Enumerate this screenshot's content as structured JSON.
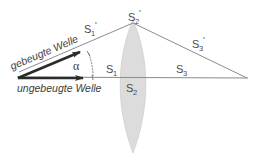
{
  "figure": {
    "background_color": "#ffffff"
  },
  "colors": {
    "lens_fill": "#dcdcdc",
    "lens_stroke": "#c8c8c8",
    "ray_stroke": "#8c8c8c",
    "axis_stroke": "#8c8c8c",
    "arrow_color": "#2b2b2b",
    "label_color": "#4a4a4a",
    "text_color": "#3d3d3d",
    "arc_color": "#6e6e6e"
  },
  "labels": {
    "s1_prime": {
      "base": "S",
      "sub": "1",
      "prime": "'"
    },
    "s2_prime": {
      "base": "S",
      "sub": "2",
      "prime": "'"
    },
    "s3_prime": {
      "base": "S",
      "sub": "3",
      "prime": "'"
    },
    "s1": {
      "base": "S",
      "sub": "1",
      "prime": ""
    },
    "s2": {
      "base": "S",
      "sub": "2",
      "prime": ""
    },
    "s3": {
      "base": "S",
      "sub": "3",
      "prime": ""
    },
    "alpha": "α"
  },
  "waves": {
    "diffracted": "gebeugte Welle",
    "undiffracted": "ungebeugte Welle"
  },
  "geometry": {
    "origin": {
      "x": 17,
      "y": 77
    },
    "lens_top": {
      "x": 133,
      "y": 23
    },
    "focus_right": {
      "x": 247,
      "y": 78
    },
    "lens_center_x": 133,
    "lens_half_width": 20,
    "lens_top_y": 20,
    "lens_bottom_y": 153,
    "axis_y": 77,
    "alpha_degrees": 26
  }
}
